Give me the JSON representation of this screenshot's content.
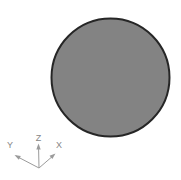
{
  "viewport": {
    "background_color": "#ffffff",
    "model": {
      "shape": "disc",
      "fill_color": "#838383",
      "outline_color": "#262626"
    },
    "triad": {
      "axes": [
        {
          "id": "z",
          "label": "Z"
        },
        {
          "id": "y",
          "label": "Y"
        },
        {
          "id": "x",
          "label": "X"
        }
      ],
      "line_color": "#9b9b9b",
      "label_color": "#868686"
    }
  }
}
